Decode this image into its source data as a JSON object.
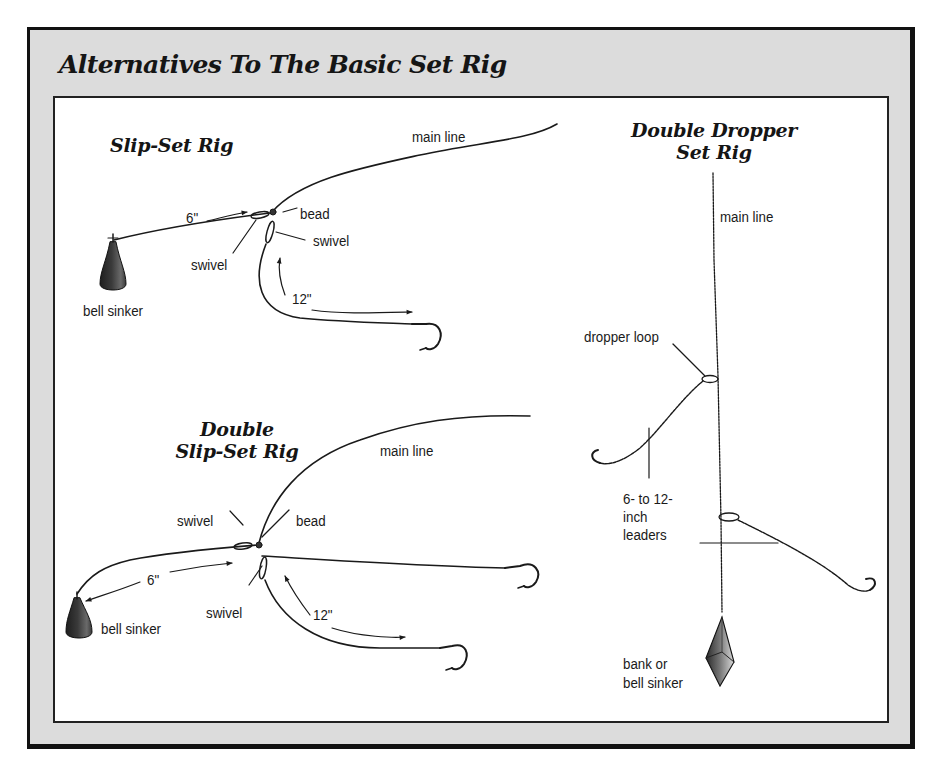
{
  "title": "Alternatives To The Basic Set Rig",
  "colors": {
    "frame_background": "#dcdcdc",
    "frame_border": "#111111",
    "panel_background": "#ffffff",
    "ink": "#1a1a1a"
  },
  "rigs": {
    "slip_set": {
      "title": "Slip-Set Rig",
      "labels": {
        "main_line": "main line",
        "six_inch": "6\"",
        "bead": "bead",
        "swivel_left": "swivel",
        "swivel_right": "swivel",
        "twelve_inch": "12\"",
        "bell_sinker": "bell sinker"
      }
    },
    "double_slip_set": {
      "title_line1": "Double",
      "title_line2": "Slip-Set Rig",
      "labels": {
        "main_line": "main line",
        "swivel_top": "swivel",
        "bead": "bead",
        "six_inch": "6\"",
        "swivel_bottom": "swivel",
        "twelve_inch": "12\"",
        "bell_sinker": "bell sinker"
      }
    },
    "double_dropper": {
      "title_line1": "Double Dropper",
      "title_line2": "Set Rig",
      "labels": {
        "main_line": "main line",
        "dropper_loop": "dropper loop",
        "leaders_line1": "6- to 12-",
        "leaders_line2": "inch",
        "leaders_line3": "leaders",
        "sinker_line1": "bank or",
        "sinker_line2": "bell sinker"
      }
    }
  }
}
